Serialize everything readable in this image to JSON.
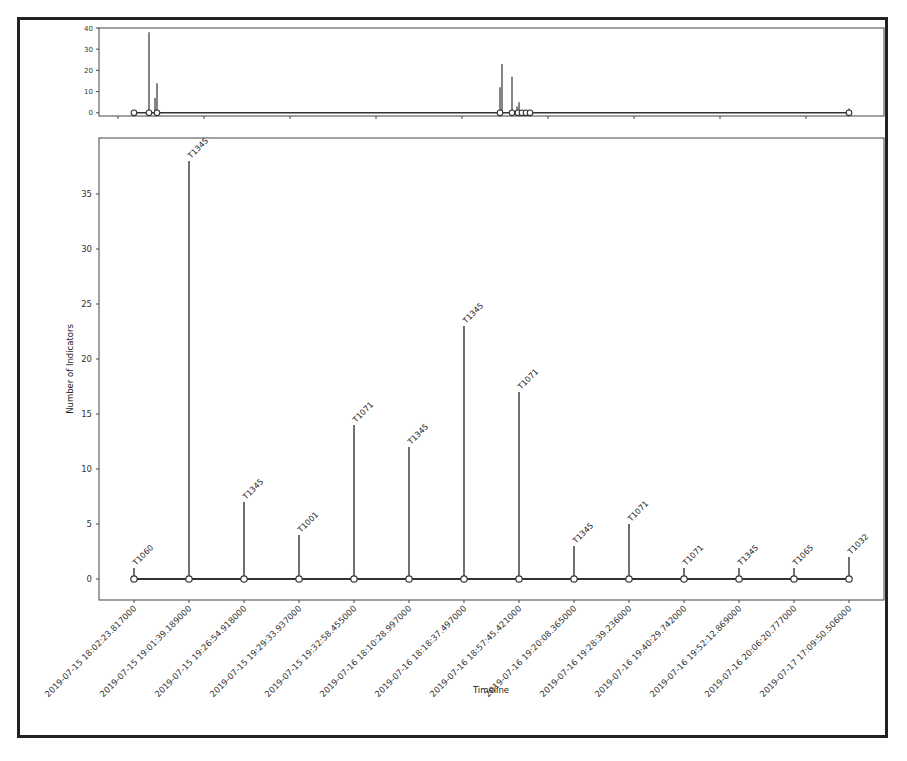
{
  "chart_data": [
    {
      "name": "overview",
      "type": "stem",
      "title": "",
      "xlabel": "",
      "ylabel": "",
      "ylim": [
        -1.5,
        40
      ],
      "yticks": [
        0,
        10,
        20,
        30,
        40
      ],
      "grid": false,
      "note": "Overview timeline (continuous time axis) showing all 14 events; x tick labels hidden",
      "points_px_x": [
        134,
        149,
        155,
        157,
        500,
        502,
        512,
        517,
        519,
        522,
        525,
        528,
        531,
        849
      ],
      "values": [
        1,
        38,
        7,
        14,
        12,
        23,
        17,
        3,
        5,
        1,
        1,
        1,
        1,
        2
      ]
    },
    {
      "name": "main",
      "type": "stem",
      "title": "",
      "xlabel": "Timeline",
      "ylabel": "Number of Indicators",
      "ylim": [
        -1.9,
        40
      ],
      "yticks": [
        0,
        5,
        10,
        15,
        20,
        25,
        30,
        35
      ],
      "grid": false,
      "legend": "none",
      "categories": [
        "2019-07-15 18:02:23.817000",
        "2019-07-15 19:01:39.189000",
        "2019-07-15 19:26:54.918000",
        "2019-07-15 19:29:33.937000",
        "2019-07-15 19:32:58.455000",
        "2019-07-16 18:10:28.997000",
        "2019-07-16 18:18:37.497000",
        "2019-07-16 18:57:45.421000",
        "2019-07-16 19:20:08.365000",
        "2019-07-16 19:28:39.236000",
        "2019-07-16 19:40:29.742000",
        "2019-07-16 19:52:12.869000",
        "2019-07-16 20:06:20.777000",
        "2019-07-17 17:09:50.506000"
      ],
      "values": [
        1,
        38,
        7,
        4,
        14,
        12,
        23,
        17,
        3,
        5,
        1,
        1,
        1,
        2
      ],
      "annotations": [
        "T1060",
        "T1345",
        "T1345",
        "T1001",
        "T1071",
        "T1345",
        "T1345",
        "T1071",
        "T1345",
        "T1071",
        "T1071",
        "T1345",
        "T1065",
        "T1032"
      ]
    }
  ],
  "labels": {
    "xlabel": "Timeline",
    "ylabel": "Number of Indicators"
  },
  "colors": {
    "stem": "#333333",
    "marker_fill": "#ffffff",
    "axes": "#444444"
  }
}
